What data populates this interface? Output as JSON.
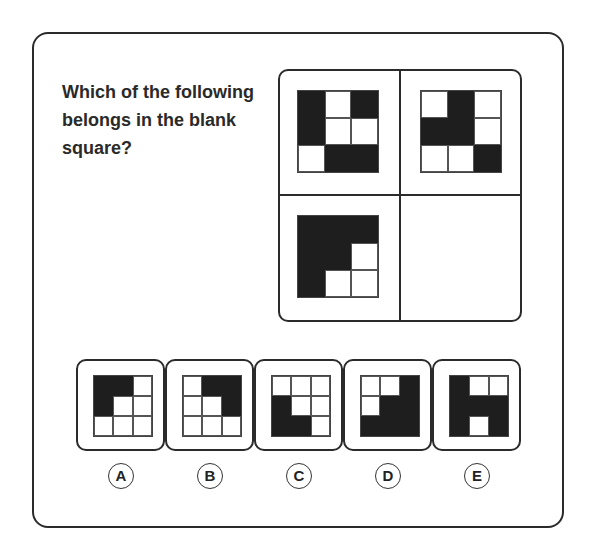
{
  "question": "Which of the following belongs in the blank square?",
  "matrix": {
    "cells": [
      {
        "position": "top-left",
        "pattern": [
          [
            1,
            0,
            1
          ],
          [
            1,
            0,
            0
          ],
          [
            0,
            1,
            1
          ]
        ]
      },
      {
        "position": "top-right",
        "pattern": [
          [
            0,
            1,
            0
          ],
          [
            1,
            1,
            0
          ],
          [
            0,
            0,
            1
          ]
        ]
      },
      {
        "position": "bottom-left",
        "pattern": [
          [
            1,
            1,
            1
          ],
          [
            1,
            1,
            0
          ],
          [
            1,
            0,
            0
          ]
        ]
      },
      {
        "position": "bottom-right",
        "pattern": null,
        "blank": true
      }
    ]
  },
  "options": [
    {
      "label": "A",
      "pattern": [
        [
          1,
          1,
          0
        ],
        [
          1,
          0,
          0
        ],
        [
          0,
          0,
          0
        ]
      ]
    },
    {
      "label": "B",
      "pattern": [
        [
          0,
          1,
          1
        ],
        [
          0,
          0,
          1
        ],
        [
          0,
          0,
          0
        ]
      ]
    },
    {
      "label": "C",
      "pattern": [
        [
          0,
          0,
          0
        ],
        [
          1,
          0,
          0
        ],
        [
          1,
          1,
          0
        ]
      ]
    },
    {
      "label": "D",
      "pattern": [
        [
          0,
          0,
          1
        ],
        [
          0,
          1,
          1
        ],
        [
          1,
          1,
          1
        ]
      ]
    },
    {
      "label": "E",
      "pattern": [
        [
          1,
          0,
          0
        ],
        [
          1,
          1,
          1
        ],
        [
          1,
          0,
          1
        ]
      ]
    }
  ],
  "colors": {
    "filled": "#1e1e1e",
    "empty": "#ffffff",
    "border": "#2b2b2b"
  }
}
